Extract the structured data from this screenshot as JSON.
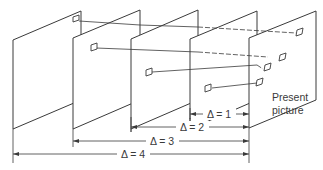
{
  "diagram": {
    "present_label_line1": "Present",
    "present_label_line2": "picture",
    "dimensions": [
      {
        "label": "Δ = 1"
      },
      {
        "label": "Δ = 2"
      },
      {
        "label": "Δ = 3"
      },
      {
        "label": "Δ = 4"
      }
    ],
    "frames": [
      {
        "name": "reference-picture-delta-4"
      },
      {
        "name": "reference-picture-delta-3"
      },
      {
        "name": "reference-picture-delta-2"
      },
      {
        "name": "reference-picture-delta-1"
      },
      {
        "name": "present-picture"
      }
    ],
    "colors": {
      "line": "#3a3a3a",
      "background": "#ffffff"
    }
  }
}
